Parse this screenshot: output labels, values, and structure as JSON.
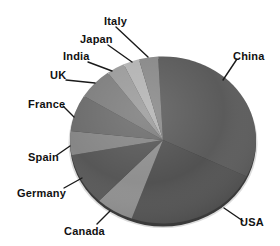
{
  "chart_data": {
    "type": "pie",
    "title": "",
    "legend_position": "none",
    "grid": false,
    "units": "percent (estimated from slice angles)",
    "categories": [
      "China",
      "USA",
      "Canada",
      "Germany",
      "Spain",
      "France",
      "UK",
      "India",
      "Japan",
      "Italy"
    ],
    "values": [
      33.1,
      23.2,
      6.6,
      10.0,
      4.6,
      7.1,
      6.1,
      3.2,
      2.8,
      3.3
    ],
    "geometry": {
      "cx": 163,
      "cy": 140,
      "rx": 93,
      "ry": 83.5,
      "start_angle_reference": "degrees clockwise from 12 o'clock"
    },
    "shadow_color": "#c9c9c9",
    "rim_color": "#3a3a3a",
    "leader_color": "#1a1a1a",
    "slices": [
      {
        "label": "China",
        "percent": 33.1,
        "start": -3,
        "end": 116,
        "color": "#5b5b5b",
        "label_pos": {
          "x": 233,
          "y": 50
        },
        "leader": {
          "x1": 237,
          "y1": 59,
          "x2": 223,
          "y2": 80
        }
      },
      {
        "label": "USA",
        "percent": 23.2,
        "start": 116,
        "end": 199.7,
        "color": "#525252",
        "label_pos": {
          "x": 240,
          "y": 216
        },
        "leader": {
          "x1": 243,
          "y1": 221,
          "x2": 224,
          "y2": 208
        }
      },
      {
        "label": "Canada",
        "percent": 6.6,
        "start": 199.7,
        "end": 223.4,
        "color": "#8f8f8f",
        "label_pos": {
          "x": 64,
          "y": 225
        },
        "leader": {
          "x1": 97,
          "y1": 224,
          "x2": 110,
          "y2": 211
        }
      },
      {
        "label": "Germany",
        "percent": 10.0,
        "start": 223.4,
        "end": 259.5,
        "color": "#575757",
        "label_pos": {
          "x": 17,
          "y": 187
        },
        "leader": {
          "x1": 64,
          "y1": 188,
          "x2": 82,
          "y2": 178
        }
      },
      {
        "label": "Spain",
        "percent": 4.6,
        "start": 259.5,
        "end": 276.1,
        "color": "#868686",
        "label_pos": {
          "x": 28,
          "y": 151
        },
        "leader": {
          "x1": 57,
          "y1": 155,
          "x2": 70,
          "y2": 146
        }
      },
      {
        "label": "France",
        "percent": 7.1,
        "start": 276.1,
        "end": 301.7,
        "color": "#6c6c6c",
        "label_pos": {
          "x": 28,
          "y": 98
        },
        "leader": {
          "x1": 63,
          "y1": 106,
          "x2": 74,
          "y2": 117
        }
      },
      {
        "label": "UK",
        "percent": 6.1,
        "start": 301.7,
        "end": 323.6,
        "color": "#7e7e7e",
        "label_pos": {
          "x": 50,
          "y": 69
        },
        "leader": {
          "x1": 66,
          "y1": 80,
          "x2": 95,
          "y2": 83
        }
      },
      {
        "label": "India",
        "percent": 3.2,
        "start": 323.6,
        "end": 335,
        "color": "#9b9b9b",
        "label_pos": {
          "x": 63,
          "y": 50
        },
        "leader": {
          "x1": 88,
          "y1": 62,
          "x2": 112,
          "y2": 71
        }
      },
      {
        "label": "Japan",
        "percent": 2.8,
        "start": 335,
        "end": 345,
        "color": "#b3b3b3",
        "label_pos": {
          "x": 80,
          "y": 33
        },
        "leader": {
          "x1": 108,
          "y1": 45,
          "x2": 132,
          "y2": 62
        }
      },
      {
        "label": "Italy",
        "percent": 3.3,
        "start": 345,
        "end": 357,
        "color": "#898989",
        "label_pos": {
          "x": 104,
          "y": 15
        },
        "leader": {
          "x1": 116,
          "y1": 27,
          "x2": 148,
          "y2": 57
        }
      }
    ]
  }
}
